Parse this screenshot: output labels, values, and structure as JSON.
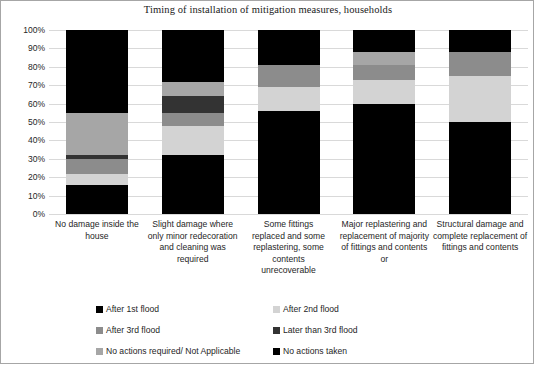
{
  "chart_data": {
    "type": "bar",
    "subtype": "stacked-100-percent-vertical",
    "title": "Timing of installation of  mitigation measures, households",
    "xlabel": "",
    "ylabel": "",
    "ylim": [
      0,
      100
    ],
    "ytick_labels": [
      "100%",
      "90%",
      "80%",
      "70%",
      "60%",
      "50%",
      "40%",
      "30%",
      "20%",
      "10%",
      "0%"
    ],
    "ytick_values": [
      100,
      90,
      80,
      70,
      60,
      50,
      40,
      30,
      20,
      10,
      0
    ],
    "grid": true,
    "legend_position": "bottom",
    "categories": [
      "No damage inside the house",
      "Slight damage where only minor redecoration and cleaning was required",
      "Some fittings replaced and some replastering, some contents unrecoverable",
      "Major replastering and replacement of majority of fittings and contents or",
      "Structural damage and complete replacement of fittings and contents"
    ],
    "series": [
      {
        "name": "After 1st flood",
        "color": "#000000",
        "values": [
          16,
          32,
          56,
          60,
          50
        ]
      },
      {
        "name": "After 2nd flood",
        "color": "#d3d3d3",
        "values": [
          6,
          16,
          13,
          13,
          25
        ]
      },
      {
        "name": "After 3rd flood",
        "color": "#8c8c8c",
        "values": [
          8,
          7,
          12,
          8,
          13
        ]
      },
      {
        "name": "Later than 3rd flood",
        "color": "#333333",
        "values": [
          2,
          9,
          0,
          0,
          0
        ]
      },
      {
        "name": "No actions required/ Not Applicable",
        "color": "#a6a6a6",
        "values": [
          23,
          8,
          0,
          7,
          0
        ]
      },
      {
        "name": "No actions taken",
        "color": "#000000",
        "values": [
          45,
          28,
          19,
          12,
          12
        ]
      }
    ]
  },
  "legend": {
    "items": [
      {
        "label": "After 1st flood",
        "color": "#000000"
      },
      {
        "label": "After 2nd flood",
        "color": "#d3d3d3"
      },
      {
        "label": "After 3rd flood",
        "color": "#8c8c8c"
      },
      {
        "label": "Later than 3rd flood",
        "color": "#333333"
      },
      {
        "label": "No actions required/ Not Applicable",
        "color": "#a6a6a6"
      },
      {
        "label": "No actions taken",
        "color": "#000000"
      }
    ]
  }
}
